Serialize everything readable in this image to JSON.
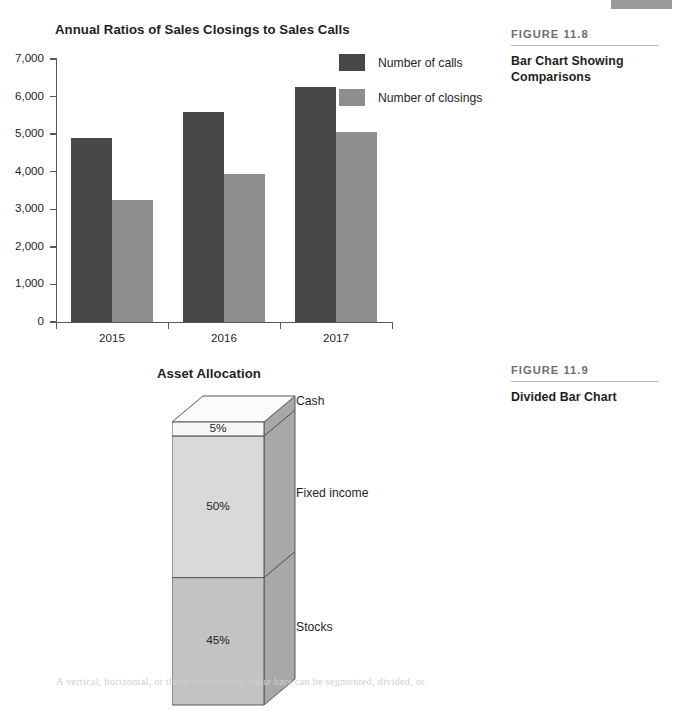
{
  "page": {
    "body_copy": "A vertical, horizontal, or three-dimensional value bars can be segmented, divided, or"
  },
  "sidebar": {
    "figure_118": {
      "number": "FIGURE 11.8",
      "caption": "Bar Chart Showing Comparisons"
    },
    "figure_119": {
      "number": "FIGURE 11.9",
      "caption": "Divided Bar Chart"
    }
  },
  "colors": {
    "series_calls": "#484848",
    "series_closings": "#8e8e8e",
    "axis": "#58595b",
    "cash_face": "#f7f7f7",
    "fixed_income_face": "#d9d9d9",
    "stocks_face": "#c3c3c3",
    "side_face": "#a8a8a8",
    "top_face": "#fbfbfb",
    "outline": "#58595b",
    "rule": "#b9babc",
    "fignum_text": "#6d6e71",
    "bleed_tab": "#9a9a9a"
  },
  "chart_data": [
    {
      "id": "bar-chart",
      "type": "bar",
      "title": "Annual Ratios of Sales Closings to Sales Calls",
      "xlabel": "",
      "ylabel": "",
      "categories": [
        "2015",
        "2016",
        "2017"
      ],
      "series": [
        {
          "name": "Number of calls",
          "color": "#484848",
          "values": [
            4900,
            5600,
            6250
          ]
        },
        {
          "name": "Number of closings",
          "color": "#8e8e8e",
          "values": [
            3250,
            3950,
            5050
          ]
        }
      ],
      "ylim": [
        0,
        7000
      ],
      "yticks": [
        0,
        1000,
        2000,
        3000,
        4000,
        5000,
        6000,
        7000
      ],
      "ytick_labels": [
        "0",
        "1,000",
        "2,000",
        "3,000",
        "4,000",
        "5,000",
        "6,000",
        "7,000"
      ],
      "grid": false,
      "legend_position": "upper-right-outside"
    },
    {
      "id": "divided-bar-chart",
      "type": "bar",
      "subtype": "divided-stacked-3d",
      "title": "Asset Allocation",
      "categories": [
        "Asset Allocation"
      ],
      "segments": [
        {
          "name": "Cash",
          "value": 5,
          "label": "5%",
          "color": "#f7f7f7"
        },
        {
          "name": "Fixed income",
          "value": 50,
          "label": "50%",
          "color": "#d9d9d9"
        },
        {
          "name": "Stocks",
          "value": 45,
          "label": "45%",
          "color": "#c3c3c3"
        }
      ],
      "total": 100,
      "unit": "%",
      "grid": false,
      "legend_position": "labels-right-of-bar"
    }
  ]
}
